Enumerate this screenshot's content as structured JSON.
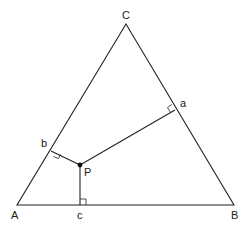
{
  "diagram": {
    "vertices": [
      {
        "id": "A",
        "label": "A",
        "x": 17,
        "y": 205,
        "lx": 11,
        "ly": 219
      },
      {
        "id": "B",
        "label": "B",
        "x": 234,
        "y": 205,
        "lx": 231,
        "ly": 219
      },
      {
        "id": "C",
        "label": "C",
        "x": 126,
        "y": 24,
        "lx": 122,
        "ly": 19
      }
    ],
    "point_P": {
      "label": "P",
      "x": 80,
      "y": 165,
      "lx": 84,
      "ly": 176
    },
    "feet": [
      {
        "id": "a",
        "label": "a",
        "x": 175,
        "y": 110,
        "lx": 180,
        "ly": 107
      },
      {
        "id": "b",
        "label": "b",
        "x": 51,
        "y": 151,
        "lx": 41,
        "ly": 147
      },
      {
        "id": "c",
        "label": "c",
        "x": 80,
        "y": 205,
        "lx": 77,
        "ly": 219
      }
    ]
  }
}
